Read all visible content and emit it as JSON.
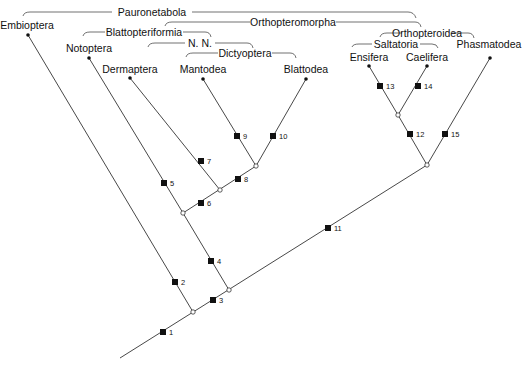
{
  "diagram": {
    "type": "cladogram",
    "taxa": [
      "Embioptera",
      "Notoptera",
      "Dermaptera",
      "Mantodea",
      "Blattodea",
      "Ensifera",
      "Caelifera",
      "Phasmatodea"
    ],
    "groups": {
      "paurometabola": "Pauronetabola",
      "orthopteromorpha": "Orthopteromorpha",
      "blattopteriformia": "Blattopteriformia",
      "nn": "N. N.",
      "dictyoptera": "Dictyoptera",
      "orthopteroidea": "Orthopteroidea",
      "saltatoria": "Saltatoria"
    },
    "apomorphies": [
      "1",
      "2",
      "3",
      "4",
      "5",
      "6",
      "7",
      "8",
      "9",
      "10",
      "11",
      "12",
      "13",
      "14",
      "15"
    ]
  }
}
